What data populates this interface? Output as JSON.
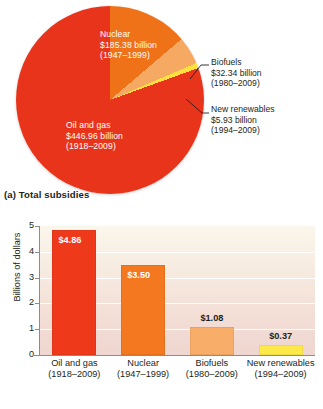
{
  "figure": {
    "panel_a_caption": "(a) Total subsidies",
    "panel_b_caption": "(b) Per-year subsidies"
  },
  "pie": {
    "slices": [
      {
        "key": "oil_gas",
        "name": "Oil and gas",
        "amount": "$446.96 billion",
        "years": "(1918–2009)",
        "value": 446.96,
        "color": "#e8341a",
        "percent": 66.6
      },
      {
        "key": "nuclear",
        "name": "Nuclear",
        "amount": "$185.38 billion",
        "years": "(1947–1999)",
        "value": 185.38,
        "color": "#ef7218",
        "percent": 27.6
      },
      {
        "key": "biofuels",
        "name": "Biofuels",
        "amount": "$32.34 billion",
        "years": "(1980–2009)",
        "value": 32.34,
        "color": "#f6a962",
        "percent": 4.8
      },
      {
        "key": "new_renewables",
        "name": "New renewables",
        "amount": "$5.93 billion",
        "years": "(1994–2009)",
        "value": 5.93,
        "color": "#ffe03d",
        "percent": 0.9
      }
    ],
    "labels": {
      "nuclear_l1": "Nuclear",
      "nuclear_l2": "$185.38 billion",
      "nuclear_l3": "(1947–1999)",
      "oilgas_l1": "Oil and gas",
      "oilgas_l2": "$446.96 billion",
      "oilgas_l3": "(1918–2009)",
      "biofuels_l1": "Biofuels",
      "biofuels_l2": "$32.34 billion",
      "biofuels_l3": "(1980–2009)",
      "renew_l1": "New renewables",
      "renew_l2": "$5.93 billion",
      "renew_l3": "(1994–2009)"
    }
  },
  "chart_data": [
    {
      "type": "pie",
      "title": "(a) Total subsidies",
      "labels": [
        "Oil and gas",
        "Nuclear",
        "Biofuels",
        "New renewables"
      ],
      "values": [
        446.96,
        185.38,
        32.34,
        5.93
      ],
      "value_labels": [
        "$446.96 billion",
        "$185.38 billion",
        "$32.34 billion",
        "$5.93 billion"
      ],
      "sublabels": [
        "(1918–2009)",
        "(1947–1999)",
        "(1980–2009)",
        "(1994–2009)"
      ],
      "unit": "billions of dollars",
      "colors": [
        "#e8341a",
        "#ef7218",
        "#f6a962",
        "#ffe03d"
      ],
      "legend": "none (direct labels and callouts)"
    },
    {
      "type": "bar",
      "title": "(b) Per-year subsidies",
      "categories": [
        "Oil and gas",
        "Nuclear",
        "Biofuels",
        "New renewables"
      ],
      "category_sublabels": [
        "(1918–2009)",
        "(1947–1999)",
        "(1980–2009)",
        "(1994–2009)"
      ],
      "values": [
        4.86,
        3.5,
        1.08,
        0.37
      ],
      "data_labels": [
        "$4.86",
        "$3.50",
        "$1.08",
        "$0.37"
      ],
      "colors": [
        "#ee3a1b",
        "#f37820",
        "#f8ad68",
        "#fdea4a"
      ],
      "xlabel": "",
      "ylabel": "Billions of dollars",
      "ylim": [
        0,
        5
      ],
      "yticks": [
        "0",
        "1",
        "2",
        "3",
        "4",
        "5"
      ],
      "grid": "horizontal white gridlines",
      "legend": "none"
    }
  ],
  "bar_chart": {
    "ylabel": "Billions of dollars",
    "yticks": [
      "5",
      "4",
      "3",
      "2",
      "1",
      "0"
    ],
    "bars": [
      {
        "key": "oil_gas",
        "label": "Oil and gas",
        "years": "(1918–2009)",
        "value": 4.86,
        "display": "$4.86",
        "color": "#ee3a1b",
        "label_inside": true
      },
      {
        "key": "nuclear",
        "label": "Nuclear",
        "years": "(1947–1999)",
        "value": 3.5,
        "display": "$3.50",
        "color": "#f37820",
        "label_inside": true
      },
      {
        "key": "biofuels",
        "label": "Biofuels",
        "years": "(1980–2009)",
        "value": 1.08,
        "display": "$1.08",
        "color": "#f8ad68",
        "label_inside": false
      },
      {
        "key": "new_renewables",
        "label": "New renewables",
        "years": "(1994–2009)",
        "value": 0.37,
        "display": "$0.37",
        "color": "#fdea4a",
        "label_inside": false
      }
    ]
  }
}
